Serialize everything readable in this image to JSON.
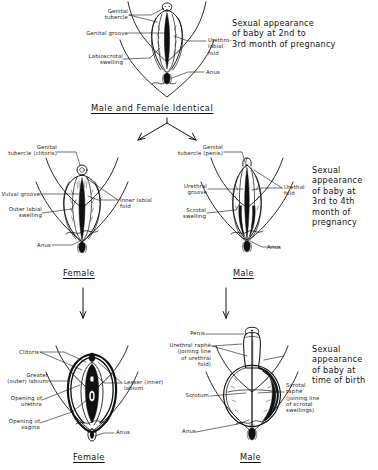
{
  "figure": {
    "background_color": "#ffffff",
    "ink_color": "#111111"
  },
  "stage_captions": {
    "stage1": "Sexual appearance\nof baby at 2nd to\n3rd month of pregnancy",
    "stage2": "Sexual\nappearance\nof baby at\n3rd to 4th\nmonth of\npregnancy",
    "stage3": "Sexual\nappearance\nof baby at\ntime of birth"
  },
  "divider": {
    "identical_label": "Male and Female Identical"
  },
  "sex_labels": {
    "female_stage2": "Female",
    "male_stage2": "Male",
    "female_stage3": "Female",
    "male_stage3": "Male"
  },
  "panels": {
    "indifferent": {
      "name": "Male and Female Identical",
      "labels": [
        {
          "id": "genital-tubercle",
          "text": "Genital\ntubercle"
        },
        {
          "id": "genital-groove",
          "text": "Genital groove"
        },
        {
          "id": "labioscrotal-swelling",
          "text": "Labioscrotal\nswelling"
        },
        {
          "id": "urethro-labial-fold",
          "text": "Urethro-\nlabial\nfold"
        },
        {
          "id": "anus",
          "text": "Anus"
        }
      ]
    },
    "female_stage2": {
      "name": "Female",
      "labels": [
        {
          "id": "genital-tubercle-clitoris",
          "text": "Genital\ntubercle (clitoris)"
        },
        {
          "id": "vulval-groove",
          "text": "Vulval groove"
        },
        {
          "id": "outer-labial-swelling",
          "text": "Outer labial\nswelling"
        },
        {
          "id": "inner-labial-fold",
          "text": "Inner labial\nfold"
        },
        {
          "id": "anus",
          "text": "Anus"
        }
      ]
    },
    "male_stage2": {
      "name": "Male",
      "labels": [
        {
          "id": "genital-tubercle-penis",
          "text": "Genital\ntubercle (penis)"
        },
        {
          "id": "urethral-groove",
          "text": "Urethral\ngroove"
        },
        {
          "id": "scrotal-swelling",
          "text": "Scrotal\nswelling"
        },
        {
          "id": "urethral-fold",
          "text": "Urethal\nfold"
        },
        {
          "id": "anus",
          "text": "Anus"
        }
      ]
    },
    "female_stage3": {
      "name": "Female",
      "labels": [
        {
          "id": "clitoris",
          "text": "Clitoris"
        },
        {
          "id": "greater-outer-labium",
          "text": "Greater\n(outer) labium"
        },
        {
          "id": "opening-of-urethra",
          "text": "Opening of\nurethra"
        },
        {
          "id": "opening-of-vagina",
          "text": "Opening of\nvagina"
        },
        {
          "id": "lesser-inner-labium",
          "text": "Lesser (inner)\nlabium"
        },
        {
          "id": "anus",
          "text": "Anus"
        }
      ]
    },
    "male_stage3": {
      "name": "Male",
      "labels": [
        {
          "id": "penis",
          "text": "Penis"
        },
        {
          "id": "urethral-raphe",
          "text": "Urethral raphé\n(joining line\nof urethral\nfold)"
        },
        {
          "id": "scrotum",
          "text": "Scrotum"
        },
        {
          "id": "scrotal-raphe",
          "text": "Scrotal\nraphé\n(joining line\nof scrotal\nswellings)"
        },
        {
          "id": "anus",
          "text": "Anus"
        }
      ]
    }
  }
}
